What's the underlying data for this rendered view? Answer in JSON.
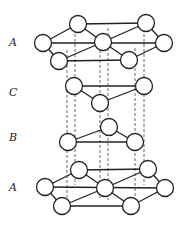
{
  "diagram": {
    "layers": [
      {
        "label": "A",
        "label_pos": [
          9,
          36
        ]
      },
      {
        "label": "C",
        "label_pos": [
          9,
          86
        ]
      },
      {
        "label": "B",
        "label_pos": [
          9,
          131
        ]
      },
      {
        "label": "A",
        "label_pos": [
          9,
          181
        ]
      }
    ],
    "colors": {
      "stroke": "#222222",
      "fill": "#ffffff",
      "background": "#ffffff"
    }
  }
}
